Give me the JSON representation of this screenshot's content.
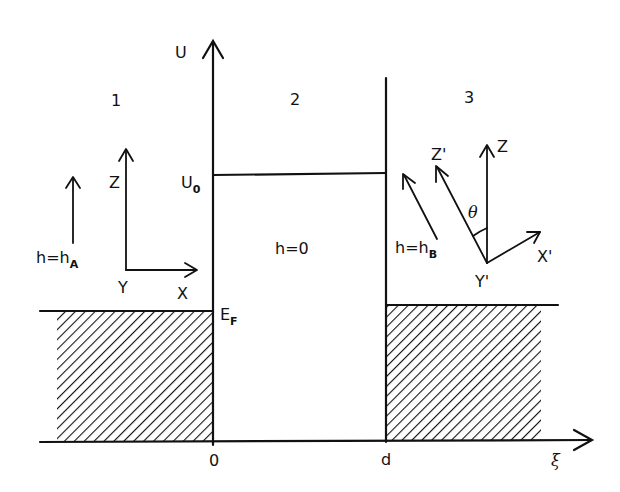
{
  "diagram": {
    "type": "energy-band-junction-schematic",
    "axes": {
      "vertical_label": "U",
      "horizontal_label": "ξ",
      "origin_label": "0",
      "barrier_width_label": "d"
    },
    "levels": {
      "barrier_height_label": "U",
      "barrier_height_sub": "0",
      "fermi_label": "E",
      "fermi_sub": "F"
    },
    "regions": [
      {
        "id": "1",
        "label": "1",
        "field_label": "h=h",
        "field_sub": "A",
        "frame": {
          "z": "Z",
          "x": "X",
          "y": "Y"
        }
      },
      {
        "id": "2",
        "label": "2",
        "field_label": "h=0"
      },
      {
        "id": "3",
        "label": "3",
        "field_label": "h=h",
        "field_sub": "B",
        "frame": {
          "z": "Z",
          "z_rot": "Z'",
          "x_rot": "X'",
          "y_rot": "Y'",
          "angle": "θ"
        }
      }
    ],
    "colors": {
      "ink": "#111111",
      "background": "#ffffff"
    }
  }
}
